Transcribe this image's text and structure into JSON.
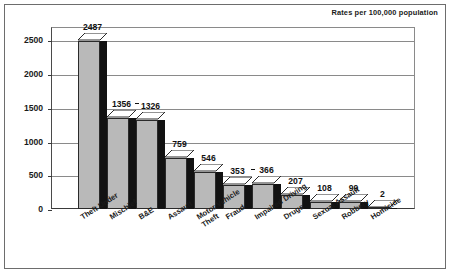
{
  "caption": "Rates per 100,000 population",
  "colors": {
    "bar_front": "#b9b9b9",
    "bar_side": "#121212",
    "bar_top": "#ffffff",
    "grid": "#8a8a8a",
    "axis": "#3a3a3a",
    "frame": "#6d6d6d",
    "text": "#1a1a1a",
    "background": "#ffffff"
  },
  "chart_data": {
    "type": "bar",
    "title": "",
    "subtitle": "",
    "annotations": [
      "Rates per 100,000 population"
    ],
    "xlabel": "",
    "ylabel": "",
    "ylim": [
      0,
      2700
    ],
    "yticks": [
      0,
      500,
      1000,
      1500,
      2000,
      2500
    ],
    "ytick_labels": [
      "0",
      "500",
      "1000",
      "1500",
      "2000",
      "2500"
    ],
    "grid": true,
    "legend": "none",
    "style": "3d-bar",
    "categories": [
      "Theft Under",
      "Mischief",
      "B&E",
      "Assault",
      "Motor Vehicle\nTheft",
      "Fraud",
      "Impaired Driving",
      "Drugs",
      "Sexual Assault",
      "Robbery",
      "Homicide"
    ],
    "values": [
      2487,
      1356,
      1326,
      759,
      546,
      353,
      366,
      207,
      108,
      99,
      2
    ],
    "value_labels": [
      "2487",
      "1356",
      "1326",
      "759",
      "546",
      "353",
      "366",
      "207",
      "108",
      "99",
      "2"
    ],
    "paired_connectors": [
      [
        1,
        2
      ],
      [
        5,
        6
      ]
    ]
  }
}
